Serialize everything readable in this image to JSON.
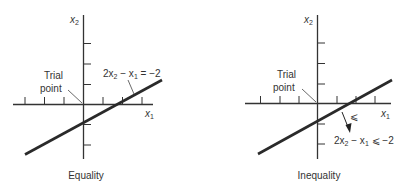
{
  "panels": [
    {
      "id": "equality",
      "caption": "Equality",
      "x_axis_label": "x",
      "x_axis_sub": "1",
      "y_axis_label": "x",
      "y_axis_sub": "2",
      "trial_point_label_line1": "Trial",
      "trial_point_label_line2": "point",
      "constraint": {
        "prefix": "2x",
        "sub1": "2",
        "middle": " − x",
        "sub2": "1",
        "suffix": " = −2"
      }
    },
    {
      "id": "inequality",
      "caption": "Inequality",
      "x_axis_label": "x",
      "x_axis_sub": "1",
      "y_axis_label": "x",
      "y_axis_sub": "2",
      "trial_point_label_line1": "Trial",
      "trial_point_label_line2": "point",
      "direction_symbol": "⩽",
      "constraint": {
        "prefix": "2x",
        "sub1": "2",
        "middle": " − x",
        "sub2": "1",
        "suffix": " ⩽ −2"
      }
    }
  ],
  "colors": {
    "ink": "#333333",
    "background": "#ffffff"
  }
}
